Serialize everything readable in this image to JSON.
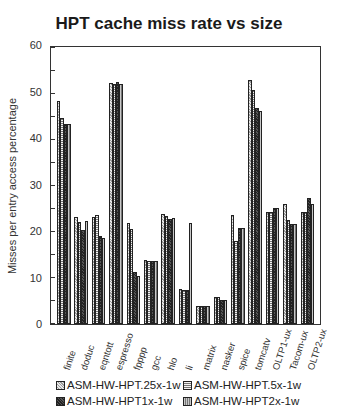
{
  "chart_data": {
    "type": "bar",
    "title": "HPT cache miss rate vs size",
    "xlabel": "",
    "ylabel": "Misses per entry access percentage",
    "ylim": [
      0,
      60
    ],
    "yticks": [
      0,
      10,
      20,
      30,
      40,
      50,
      60
    ],
    "grid": false,
    "legend_position": "bottom",
    "categories": [
      "finite",
      "doduc",
      "eqntott",
      "espresso",
      "fpppp",
      "gcc",
      "hlo",
      "li",
      "matrix",
      "nasker",
      "spice",
      "tomcatv",
      "OLTP1-ux",
      "Tacom-ux",
      "OLTP2-ux"
    ],
    "series": [
      {
        "name": "ASM-HW-HPT.25x-1w",
        "values": [
          48.5,
          23.2,
          23.2,
          52.3,
          21.9,
          14.0,
          24.0,
          7.7,
          3.9,
          5.8,
          23.8,
          53.1,
          24.3,
          26.0,
          24.3
        ]
      },
      {
        "name": "ASM-HW-HPT.5x-1w",
        "values": [
          44.7,
          22.1,
          23.7,
          52.2,
          20.6,
          13.8,
          23.5,
          7.5,
          3.9,
          5.8,
          18.0,
          50.8,
          24.3,
          22.6,
          24.3
        ]
      },
      {
        "name": "ASM-HW-HPT1x-1w",
        "values": [
          43.4,
          20.4,
          19.1,
          52.7,
          11.4,
          13.8,
          22.8,
          7.3,
          3.9,
          5.2,
          20.8,
          46.9,
          25.2,
          21.7,
          27.5
        ]
      },
      {
        "name": "ASM-HW-HPT2x-1w",
        "values": [
          43.4,
          22.4,
          18.7,
          52.2,
          10.5,
          13.8,
          23.0,
          21.9,
          3.9,
          5.2,
          20.8,
          46.2,
          25.2,
          21.7,
          26.0
        ]
      }
    ]
  },
  "legend": {
    "items": [
      {
        "label": "ASM-HW-HPT.25x-1w"
      },
      {
        "label": "ASM-HW-HPT.5x-1w"
      },
      {
        "label": "ASM-HW-HPT1x-1w"
      },
      {
        "label": "ASM-HW-HPT2x-1w"
      }
    ]
  }
}
